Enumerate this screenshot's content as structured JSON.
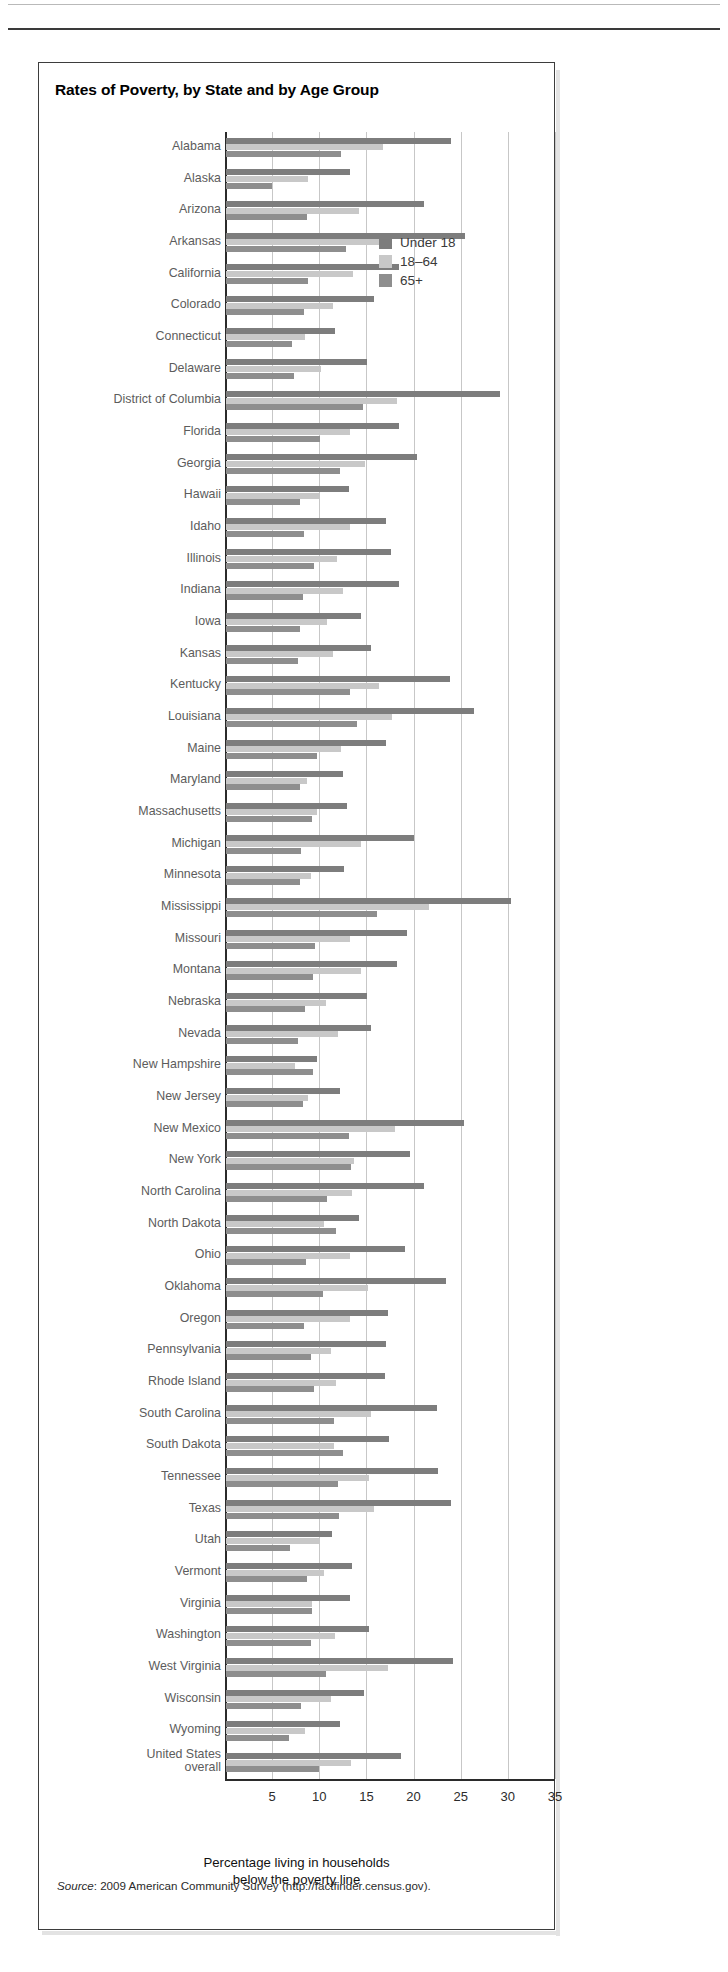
{
  "page": {
    "header_crumb": "",
    "background": "#ffffff"
  },
  "figure": {
    "title": "Rates of Poverty, by State and by Age Group",
    "source_prefix": "Source",
    "source_text": ": 2009 American Community Survey (http://factfinder.census.gov)."
  },
  "legend": {
    "position": "inside-top-right",
    "items": [
      {
        "label": "Under 18",
        "color": "#7d7d7d"
      },
      {
        "label": "18–64",
        "color": "#c8c8c8"
      },
      {
        "label": "65+",
        "color": "#8e8e8e"
      }
    ]
  },
  "axis": {
    "xlabel_line1": "Percentage living in households",
    "xlabel_line2": "below the poverty line",
    "ticks": [
      5,
      10,
      15,
      20,
      25,
      30,
      35
    ],
    "tick_labels": [
      "5",
      "10",
      "15",
      "20",
      "25",
      "30",
      "35"
    ],
    "xlim": [
      0,
      35
    ]
  },
  "chart_data": {
    "type": "bar",
    "orientation": "horizontal",
    "title": "Rates of Poverty, by State and by Age Group",
    "xlabel": "Percentage living in households below the poverty line",
    "ylabel": "",
    "xlim": [
      0,
      35
    ],
    "xticks": [
      5,
      10,
      15,
      20,
      25,
      30,
      35
    ],
    "grid": "vertical",
    "legend_position": "top-right",
    "series_names": [
      "Under 18",
      "18–64",
      "65+"
    ],
    "series_colors": [
      "#7d7d7d",
      "#c8c8c8",
      "#8e8e8e"
    ],
    "categories": [
      "Alabama",
      "Alaska",
      "Arizona",
      "Arkansas",
      "California",
      "Colorado",
      "Connecticut",
      "Delaware",
      "District of Columbia",
      "Florida",
      "Georgia",
      "Hawaii",
      "Idaho",
      "Illinois",
      "Indiana",
      "Iowa",
      "Kansas",
      "Kentucky",
      "Louisiana",
      "Maine",
      "Maryland",
      "Massachusetts",
      "Michigan",
      "Minnesota",
      "Mississippi",
      "Missouri",
      "Montana",
      "Nebraska",
      "Nevada",
      "New Hampshire",
      "New Jersey",
      "New Mexico",
      "New York",
      "North Carolina",
      "North Dakota",
      "Ohio",
      "Oklahoma",
      "Oregon",
      "Pennsylvania",
      "Rhode Island",
      "South Carolina",
      "South Dakota",
      "Tennessee",
      "Texas",
      "Utah",
      "Vermont",
      "Virginia",
      "Washington",
      "West Virginia",
      "Wisconsin",
      "Wyoming",
      "United States\noverall"
    ],
    "series": [
      {
        "name": "Under 18",
        "values": [
          23.9,
          13.2,
          21.0,
          25.3,
          18.4,
          15.7,
          11.6,
          15.0,
          29.1,
          18.4,
          20.3,
          13.0,
          17.0,
          17.5,
          18.3,
          14.3,
          15.4,
          23.8,
          26.3,
          17.0,
          12.4,
          12.8,
          19.9,
          12.5,
          30.2,
          19.2,
          18.1,
          15.0,
          15.4,
          9.6,
          12.1,
          25.2,
          19.5,
          21.0,
          14.1,
          19.0,
          23.3,
          17.2,
          17.0,
          16.9,
          22.4,
          17.3,
          22.5,
          23.9,
          11.2,
          13.4,
          13.2,
          15.2,
          24.1,
          14.6,
          12.1,
          18.6
        ]
      },
      {
        "name": "18–64",
        "values": [
          16.6,
          8.7,
          14.1,
          17.5,
          13.5,
          11.3,
          8.4,
          10.1,
          18.1,
          13.1,
          14.7,
          9.9,
          13.1,
          11.8,
          12.4,
          10.7,
          11.3,
          16.2,
          17.6,
          12.2,
          8.6,
          9.6,
          14.3,
          9.0,
          21.5,
          13.2,
          14.3,
          10.6,
          11.9,
          7.3,
          8.7,
          17.9,
          13.6,
          13.4,
          10.4,
          13.1,
          15.1,
          13.1,
          11.1,
          11.7,
          15.4,
          11.5,
          15.2,
          15.7,
          10.0,
          10.4,
          9.1,
          11.6,
          17.2,
          11.1,
          8.4,
          13.3
        ]
      },
      {
        "name": "65+",
        "values": [
          12.2,
          4.9,
          8.6,
          12.7,
          8.7,
          8.3,
          7.0,
          7.2,
          14.5,
          10.0,
          12.1,
          7.8,
          8.3,
          9.3,
          8.2,
          7.9,
          7.6,
          13.1,
          13.9,
          9.6,
          7.9,
          9.1,
          8.0,
          7.9,
          16.0,
          9.4,
          9.2,
          8.4,
          7.6,
          9.2,
          8.2,
          13.0,
          13.3,
          10.7,
          11.7,
          8.5,
          10.3,
          8.3,
          9.0,
          9.3,
          11.5,
          12.4,
          11.9,
          12.0,
          6.8,
          8.6,
          9.1,
          9.0,
          10.6,
          8.0,
          6.7,
          9.9
        ]
      }
    ]
  }
}
